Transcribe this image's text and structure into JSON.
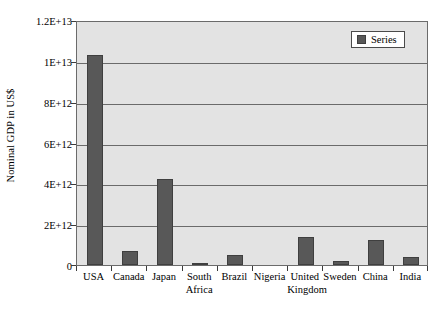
{
  "chart_data": {
    "type": "bar",
    "title": "",
    "xlabel": "",
    "ylabel": "Nominal GDP in US$",
    "ylim": [
      0,
      12000000000000
    ],
    "grid": true,
    "legend_position": "top-right",
    "categories": [
      "USA",
      "Canada",
      "Japan",
      "South Africa",
      "Brazil",
      "Nigeria",
      "United Kingdom",
      "Sweden",
      "China",
      "India"
    ],
    "series": [
      {
        "name": "Series",
        "color": "#585858",
        "values": [
          10300000000000,
          690000000000,
          4200000000000,
          110000000000,
          510000000000,
          0,
          1370000000000,
          200000000000,
          1220000000000,
          400000000000
        ]
      }
    ],
    "y_ticks": [
      {
        "value": 0,
        "label": "0"
      },
      {
        "value": 2000000000000,
        "label": "2E+12"
      },
      {
        "value": 4000000000000,
        "label": "4E+12"
      },
      {
        "value": 6000000000000,
        "label": "6E+12"
      },
      {
        "value": 8000000000000,
        "label": "8E+12"
      },
      {
        "value": 10000000000000,
        "label": "1E+13"
      },
      {
        "value": 12000000000000,
        "label": "1.2E+13"
      }
    ],
    "x_tick_labels": [
      {
        "line1": "USA",
        "line2": ""
      },
      {
        "line1": "Canada",
        "line2": ""
      },
      {
        "line1": "Japan",
        "line2": ""
      },
      {
        "line1": "South",
        "line2": "Africa"
      },
      {
        "line1": "Brazil",
        "line2": ""
      },
      {
        "line1": "Nigeria",
        "line2": ""
      },
      {
        "line1": "United",
        "line2": "Kingdom"
      },
      {
        "line1": "Sweden",
        "line2": ""
      },
      {
        "line1": "China",
        "line2": ""
      },
      {
        "line1": "India",
        "line2": ""
      }
    ]
  },
  "legend": {
    "entries": [
      {
        "label": "Series",
        "color": "#585858"
      }
    ]
  },
  "colors": {
    "bar": "#585858",
    "bar_border": "#3f3f3f",
    "plot_background": "#e3e3e3",
    "plot_border": "#6b6b6b",
    "gridline": "#6b6b6b",
    "page_background": "#ffffff",
    "text": "#000000"
  }
}
